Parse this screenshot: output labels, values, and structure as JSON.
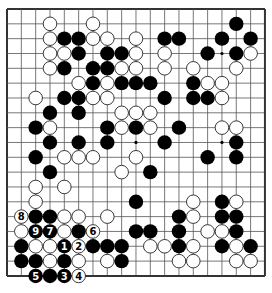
{
  "board": {
    "size": 19,
    "origin": {
      "x": 7,
      "y": 9
    },
    "spacing": {
      "x": 14.33,
      "y": 14.83
    },
    "stone_radius": 7.2,
    "colors": {
      "background": "#ffffff",
      "grid_line": "#555555",
      "border": "#333333",
      "black_stone": "#000000",
      "white_stone": "#ffffff",
      "white_stone_edge": "#222222",
      "black_label": "#ffffff",
      "white_label": "#000000"
    },
    "star_points": [
      [
        3,
        3
      ],
      [
        3,
        9
      ],
      [
        3,
        15
      ],
      [
        9,
        3
      ],
      [
        9,
        9
      ],
      [
        9,
        15
      ],
      [
        15,
        3
      ],
      [
        15,
        9
      ],
      [
        15,
        15
      ]
    ],
    "stones": [
      {
        "row": 1,
        "col": 3,
        "color": "W"
      },
      {
        "row": 1,
        "col": 6,
        "color": "W"
      },
      {
        "row": 1,
        "col": 16,
        "color": "B"
      },
      {
        "row": 2,
        "col": 3,
        "color": "W"
      },
      {
        "row": 2,
        "col": 4,
        "color": "B"
      },
      {
        "row": 2,
        "col": 5,
        "color": "B"
      },
      {
        "row": 2,
        "col": 6,
        "color": "W"
      },
      {
        "row": 2,
        "col": 7,
        "color": "W"
      },
      {
        "row": 2,
        "col": 9,
        "color": "W"
      },
      {
        "row": 2,
        "col": 11,
        "color": "B"
      },
      {
        "row": 2,
        "col": 12,
        "color": "B"
      },
      {
        "row": 2,
        "col": 15,
        "color": "B"
      },
      {
        "row": 2,
        "col": 17,
        "color": "B"
      },
      {
        "row": 3,
        "col": 3,
        "color": "W"
      },
      {
        "row": 3,
        "col": 4,
        "color": "W"
      },
      {
        "row": 3,
        "col": 5,
        "color": "B"
      },
      {
        "row": 3,
        "col": 7,
        "color": "B"
      },
      {
        "row": 3,
        "col": 8,
        "color": "B"
      },
      {
        "row": 3,
        "col": 9,
        "color": "W"
      },
      {
        "row": 3,
        "col": 11,
        "color": "W"
      },
      {
        "row": 3,
        "col": 14,
        "color": "B"
      },
      {
        "row": 3,
        "col": 16,
        "color": "B"
      },
      {
        "row": 3,
        "col": 17,
        "color": "W"
      },
      {
        "row": 4,
        "col": 3,
        "color": "W"
      },
      {
        "row": 4,
        "col": 4,
        "color": "B"
      },
      {
        "row": 4,
        "col": 6,
        "color": "B"
      },
      {
        "row": 4,
        "col": 7,
        "color": "B"
      },
      {
        "row": 4,
        "col": 8,
        "color": "W"
      },
      {
        "row": 4,
        "col": 9,
        "color": "W"
      },
      {
        "row": 4,
        "col": 11,
        "color": "W"
      },
      {
        "row": 4,
        "col": 13,
        "color": "W"
      },
      {
        "row": 4,
        "col": 16,
        "color": "W"
      },
      {
        "row": 5,
        "col": 5,
        "color": "W"
      },
      {
        "row": 5,
        "col": 6,
        "color": "B"
      },
      {
        "row": 5,
        "col": 7,
        "color": "W"
      },
      {
        "row": 5,
        "col": 8,
        "color": "B"
      },
      {
        "row": 5,
        "col": 9,
        "color": "B"
      },
      {
        "row": 5,
        "col": 10,
        "color": "B"
      },
      {
        "row": 5,
        "col": 13,
        "color": "B"
      },
      {
        "row": 5,
        "col": 14,
        "color": "W"
      },
      {
        "row": 5,
        "col": 15,
        "color": "W"
      },
      {
        "row": 6,
        "col": 2,
        "color": "W"
      },
      {
        "row": 6,
        "col": 4,
        "color": "B"
      },
      {
        "row": 6,
        "col": 5,
        "color": "B"
      },
      {
        "row": 6,
        "col": 6,
        "color": "W"
      },
      {
        "row": 6,
        "col": 7,
        "color": "W"
      },
      {
        "row": 6,
        "col": 11,
        "color": "B"
      },
      {
        "row": 6,
        "col": 13,
        "color": "B"
      },
      {
        "row": 6,
        "col": 14,
        "color": "B"
      },
      {
        "row": 6,
        "col": 15,
        "color": "W"
      },
      {
        "row": 7,
        "col": 3,
        "color": "B"
      },
      {
        "row": 7,
        "col": 5,
        "color": "B"
      },
      {
        "row": 7,
        "col": 8,
        "color": "W"
      },
      {
        "row": 7,
        "col": 9,
        "color": "W"
      },
      {
        "row": 7,
        "col": 10,
        "color": "W"
      },
      {
        "row": 8,
        "col": 2,
        "color": "B"
      },
      {
        "row": 8,
        "col": 3,
        "color": "W"
      },
      {
        "row": 8,
        "col": 7,
        "color": "B"
      },
      {
        "row": 8,
        "col": 8,
        "color": "W"
      },
      {
        "row": 8,
        "col": 9,
        "color": "B"
      },
      {
        "row": 8,
        "col": 10,
        "color": "W"
      },
      {
        "row": 8,
        "col": 12,
        "color": "B"
      },
      {
        "row": 8,
        "col": 15,
        "color": "W"
      },
      {
        "row": 8,
        "col": 16,
        "color": "W"
      },
      {
        "row": 9,
        "col": 3,
        "color": "B"
      },
      {
        "row": 9,
        "col": 5,
        "color": "B"
      },
      {
        "row": 9,
        "col": 7,
        "color": "B"
      },
      {
        "row": 9,
        "col": 11,
        "color": "B"
      },
      {
        "row": 9,
        "col": 16,
        "color": "B"
      },
      {
        "row": 10,
        "col": 2,
        "color": "B"
      },
      {
        "row": 10,
        "col": 4,
        "color": "W"
      },
      {
        "row": 10,
        "col": 5,
        "color": "W"
      },
      {
        "row": 10,
        "col": 6,
        "color": "W"
      },
      {
        "row": 10,
        "col": 9,
        "color": "W"
      },
      {
        "row": 10,
        "col": 14,
        "color": "B"
      },
      {
        "row": 10,
        "col": 16,
        "color": "B"
      },
      {
        "row": 11,
        "col": 3,
        "color": "B"
      },
      {
        "row": 11,
        "col": 8,
        "color": "W"
      },
      {
        "row": 11,
        "col": 10,
        "color": "B"
      },
      {
        "row": 12,
        "col": 2,
        "color": "W"
      },
      {
        "row": 12,
        "col": 4,
        "color": "W"
      },
      {
        "row": 13,
        "col": 2,
        "color": "W"
      },
      {
        "row": 13,
        "col": 9,
        "color": "B"
      },
      {
        "row": 13,
        "col": 13,
        "color": "W"
      },
      {
        "row": 13,
        "col": 15,
        "color": "B"
      },
      {
        "row": 13,
        "col": 16,
        "color": "W"
      },
      {
        "row": 14,
        "col": 1,
        "color": "W",
        "label": "8"
      },
      {
        "row": 14,
        "col": 2,
        "color": "B"
      },
      {
        "row": 14,
        "col": 3,
        "color": "B"
      },
      {
        "row": 14,
        "col": 4,
        "color": "W"
      },
      {
        "row": 14,
        "col": 5,
        "color": "W"
      },
      {
        "row": 14,
        "col": 7,
        "color": "W"
      },
      {
        "row": 14,
        "col": 12,
        "color": "B"
      },
      {
        "row": 14,
        "col": 13,
        "color": "W"
      },
      {
        "row": 14,
        "col": 15,
        "color": "B"
      },
      {
        "row": 14,
        "col": 16,
        "color": "B"
      },
      {
        "row": 15,
        "col": 1,
        "color": "W"
      },
      {
        "row": 15,
        "col": 2,
        "color": "B",
        "label": "9"
      },
      {
        "row": 15,
        "col": 3,
        "color": "B",
        "label": "7"
      },
      {
        "row": 15,
        "col": 4,
        "color": "W"
      },
      {
        "row": 15,
        "col": 5,
        "color": "B"
      },
      {
        "row": 15,
        "col": 6,
        "color": "W",
        "label": "6"
      },
      {
        "row": 15,
        "col": 9,
        "color": "B"
      },
      {
        "row": 15,
        "col": 10,
        "color": "B"
      },
      {
        "row": 15,
        "col": 12,
        "color": "B"
      },
      {
        "row": 15,
        "col": 14,
        "color": "W"
      },
      {
        "row": 15,
        "col": 15,
        "color": "W"
      },
      {
        "row": 15,
        "col": 16,
        "color": "B"
      },
      {
        "row": 16,
        "col": 1,
        "color": "B"
      },
      {
        "row": 16,
        "col": 2,
        "color": "W"
      },
      {
        "row": 16,
        "col": 3,
        "color": "W"
      },
      {
        "row": 16,
        "col": 4,
        "color": "B",
        "label": "1"
      },
      {
        "row": 16,
        "col": 5,
        "color": "W",
        "label": "2"
      },
      {
        "row": 16,
        "col": 6,
        "color": "B"
      },
      {
        "row": 16,
        "col": 7,
        "color": "B"
      },
      {
        "row": 16,
        "col": 8,
        "color": "B"
      },
      {
        "row": 16,
        "col": 10,
        "color": "W"
      },
      {
        "row": 16,
        "col": 11,
        "color": "W"
      },
      {
        "row": 16,
        "col": 12,
        "color": "B"
      },
      {
        "row": 16,
        "col": 13,
        "color": "W"
      },
      {
        "row": 16,
        "col": 15,
        "color": "B"
      },
      {
        "row": 16,
        "col": 16,
        "color": "W"
      },
      {
        "row": 16,
        "col": 17,
        "color": "B"
      },
      {
        "row": 17,
        "col": 1,
        "color": "B"
      },
      {
        "row": 17,
        "col": 2,
        "color": "B"
      },
      {
        "row": 17,
        "col": 3,
        "color": "W"
      },
      {
        "row": 17,
        "col": 4,
        "color": "B"
      },
      {
        "row": 17,
        "col": 5,
        "color": "W"
      },
      {
        "row": 17,
        "col": 7,
        "color": "W"
      },
      {
        "row": 17,
        "col": 8,
        "color": "B"
      },
      {
        "row": 17,
        "col": 12,
        "color": "W"
      },
      {
        "row": 17,
        "col": 13,
        "color": "W"
      },
      {
        "row": 17,
        "col": 16,
        "color": "W"
      },
      {
        "row": 17,
        "col": 17,
        "color": "W"
      },
      {
        "row": 18,
        "col": 2,
        "color": "B",
        "label": "5"
      },
      {
        "row": 18,
        "col": 3,
        "color": "B"
      },
      {
        "row": 18,
        "col": 4,
        "color": "B",
        "label": "3"
      },
      {
        "row": 18,
        "col": 5,
        "color": "W",
        "label": "4"
      }
    ]
  }
}
